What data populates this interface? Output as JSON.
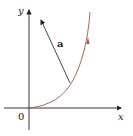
{
  "figure": {
    "axis_labels": {
      "x": "x",
      "y": "y",
      "origin": "0"
    },
    "vector_label": "a",
    "colors": {
      "axes": "#222222",
      "curve": "#9a5a4a",
      "vector": "#333333"
    }
  }
}
